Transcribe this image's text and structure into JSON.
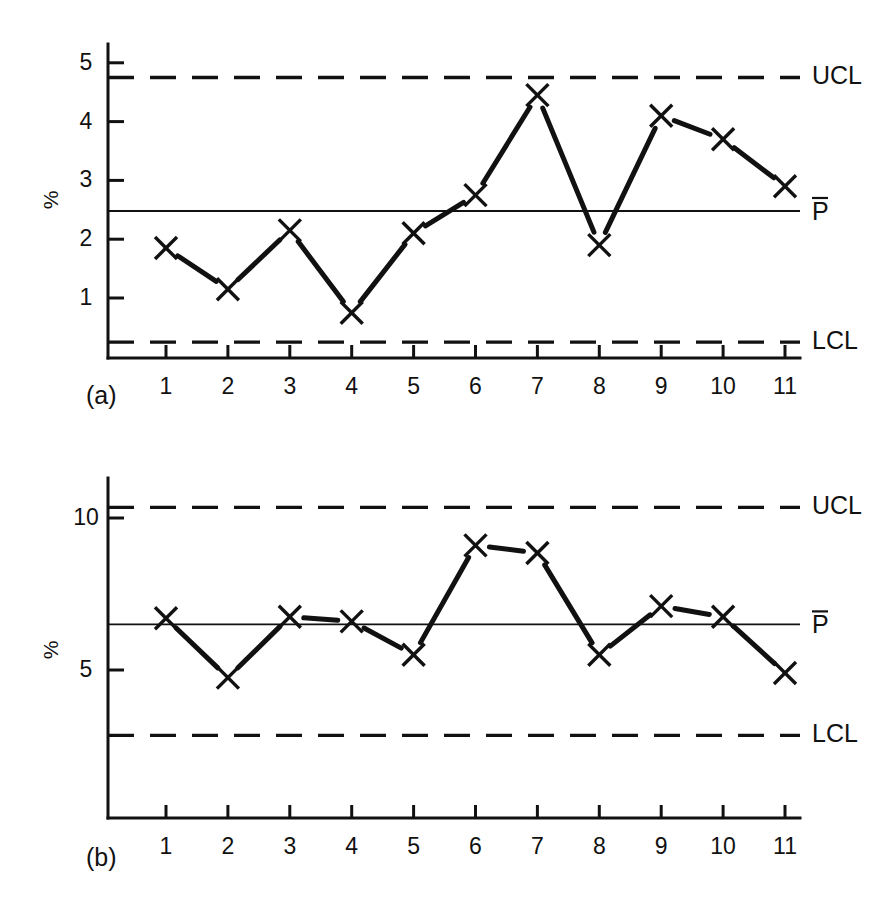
{
  "figure": {
    "background": "#ffffff",
    "ink_color": "#111111",
    "panels": [
      {
        "id": "a",
        "panel_label": "(a)",
        "ylabel": "%",
        "limit_labels": {
          "ucl": "UCL",
          "center": "P",
          "lcl": "LCL"
        },
        "center_label_has_overbar": true
      },
      {
        "id": "b",
        "panel_label": "(b)",
        "ylabel": "%",
        "limit_labels": {
          "ucl": "UCL",
          "center": "P",
          "lcl": "LCL"
        },
        "center_label_has_overbar": true
      }
    ]
  },
  "chart_data": [
    {
      "type": "line",
      "id": "a",
      "title": "",
      "xlabel": "",
      "ylabel": "%",
      "marker": "x",
      "grid": false,
      "legend": "none",
      "x": [
        1,
        2,
        3,
        4,
        5,
        6,
        7,
        8,
        9,
        10,
        11
      ],
      "categories": [
        "1",
        "2",
        "3",
        "4",
        "5",
        "6",
        "7",
        "8",
        "9",
        "10",
        "11"
      ],
      "values": [
        1.85,
        1.15,
        2.15,
        0.75,
        2.1,
        2.75,
        4.45,
        1.9,
        4.1,
        3.7,
        2.9
      ],
      "ylim": [
        0,
        5.3
      ],
      "yticks": [
        1,
        2,
        3,
        4,
        5
      ],
      "ytick_labels": [
        "1",
        "2",
        "3",
        "4",
        "5"
      ],
      "control_limits": {
        "ucl": 4.75,
        "center": 2.48,
        "lcl": 0.25,
        "ucl_label": "UCL",
        "center_label": "P̄",
        "lcl_label": "LCL"
      },
      "annotations": [
        "(a)"
      ]
    },
    {
      "type": "line",
      "id": "b",
      "title": "",
      "xlabel": "",
      "ylabel": "%",
      "marker": "x",
      "grid": false,
      "legend": "none",
      "x": [
        1,
        2,
        3,
        4,
        5,
        6,
        7,
        8,
        9,
        10,
        11
      ],
      "categories": [
        "1",
        "2",
        "3",
        "4",
        "5",
        "6",
        "7",
        "8",
        "9",
        "10",
        "11"
      ],
      "values": [
        6.7,
        4.75,
        6.75,
        6.6,
        5.5,
        9.1,
        8.85,
        5.5,
        7.1,
        6.75,
        4.9
      ],
      "ylim": [
        0,
        11.6
      ],
      "yticks": [
        5,
        10
      ],
      "ytick_labels": [
        "5",
        "10"
      ],
      "control_limits": {
        "ucl": 10.35,
        "center": 6.5,
        "lcl": 2.85,
        "ucl_label": "UCL",
        "center_label": "P̄",
        "lcl_label": "LCL"
      },
      "annotations": [
        "(b)"
      ]
    }
  ]
}
